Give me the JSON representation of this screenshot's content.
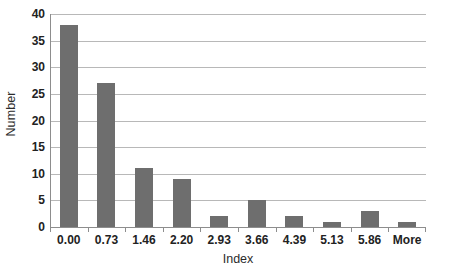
{
  "chart_data": {
    "type": "bar",
    "title": "",
    "subtitle": "",
    "xlabel": "Index",
    "ylabel": "Number",
    "categories": [
      "0.00",
      "0.73",
      "1.46",
      "2.20",
      "2.93",
      "3.66",
      "4.39",
      "5.13",
      "5.86",
      "More"
    ],
    "values": [
      38,
      27,
      11,
      9,
      2,
      5,
      2,
      1,
      3,
      1
    ],
    "ylim": [
      0,
      40
    ],
    "yticks": [
      0,
      5,
      10,
      15,
      20,
      25,
      30,
      35,
      40
    ],
    "ytick_labels": [
      "0",
      "5",
      "10",
      "15",
      "20",
      "25",
      "30",
      "35",
      "40"
    ],
    "grid": true,
    "grid_axis": "y",
    "legend": false,
    "legend_position": "none",
    "bar_color": "#6e6e6e",
    "gridline_color": "#b8b8b8",
    "axis_color": "#8d8d8d",
    "background_color": "#ffffff"
  }
}
